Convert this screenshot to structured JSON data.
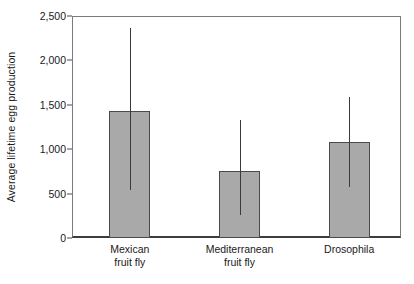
{
  "chart_data": {
    "type": "bar",
    "title": "",
    "xlabel": "",
    "ylabel": "Average lifetime egg production",
    "categories": [
      "Mexican fruit fly",
      "Mediterranean fruit fly",
      "Drosophila"
    ],
    "category_lines": [
      [
        "Mexican",
        "fruit fly"
      ],
      [
        "Mediterranean",
        "fruit fly"
      ],
      [
        "Drosophila"
      ]
    ],
    "values": [
      1430,
      755,
      1085
    ],
    "error_upper": [
      2370,
      1330,
      1590
    ],
    "error_lower": [
      540,
      255,
      575
    ],
    "ylim": [
      0,
      2500
    ],
    "yticks": [
      0,
      500,
      1000,
      1500,
      2000,
      2500
    ],
    "ytick_labels": [
      "0",
      "500",
      "1,000",
      "1,500",
      "2,000",
      "2,500"
    ],
    "grid": false,
    "legend": null,
    "bar_color": "#a9a9a9",
    "bar_edge_color": "#4a4a4a",
    "error_color": "#3a3a3a",
    "axis_color": "#3d3d3d",
    "frame_color": "#7a7a7a",
    "text_color": "#1a1a1a",
    "series": [
      {
        "name": "Average lifetime egg production",
        "values": [
          1430,
          755,
          1085
        ],
        "error_upper": [
          2370,
          1330,
          1590
        ],
        "error_lower": [
          540,
          255,
          575
        ]
      }
    ]
  }
}
